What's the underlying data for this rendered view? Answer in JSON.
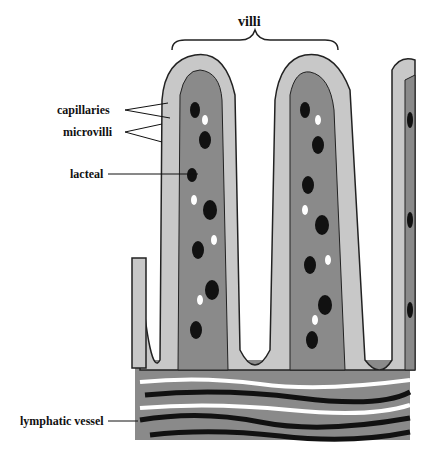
{
  "diagram": {
    "title_label": "villi",
    "labels": {
      "capillaries": "capillaries",
      "microvilli": "microvilli",
      "lacteal": "lacteal",
      "lymphatic_vessel": "lymphatic vessel"
    },
    "colors": {
      "epithelium": "#c8c8c8",
      "core": "#8a8a8a",
      "dark": "#111111",
      "line": "#222222"
    }
  }
}
